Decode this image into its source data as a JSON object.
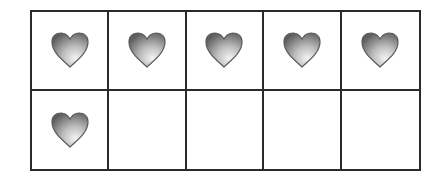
{
  "ten_frame": {
    "rows": 2,
    "columns": 5,
    "filled_count": 6,
    "total_cells": 10,
    "item_icon": "heart-icon",
    "colors": {
      "grid_line": "#2a2a2a",
      "heart_dark": "#6e6e6e",
      "heart_light": "#f2f2f2",
      "background": "#ffffff"
    },
    "cells": [
      {
        "row": 1,
        "col": 1,
        "filled": true
      },
      {
        "row": 1,
        "col": 2,
        "filled": true
      },
      {
        "row": 1,
        "col": 3,
        "filled": true
      },
      {
        "row": 1,
        "col": 4,
        "filled": true
      },
      {
        "row": 1,
        "col": 5,
        "filled": true
      },
      {
        "row": 2,
        "col": 1,
        "filled": true
      },
      {
        "row": 2,
        "col": 2,
        "filled": false
      },
      {
        "row": 2,
        "col": 3,
        "filled": false
      },
      {
        "row": 2,
        "col": 4,
        "filled": false
      },
      {
        "row": 2,
        "col": 5,
        "filled": false
      }
    ]
  }
}
